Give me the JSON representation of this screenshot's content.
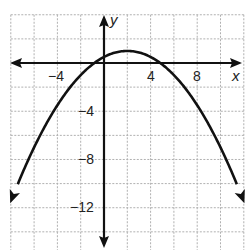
{
  "chart_data": {
    "type": "line",
    "title": "",
    "xlabel": "x",
    "ylabel": "y",
    "xlim": [
      -8,
      12
    ],
    "ylim": [
      -14,
      4
    ],
    "grid": true,
    "grid_step": 2,
    "x_tick_labels": [
      "-4",
      "4",
      "8"
    ],
    "y_tick_labels": [
      "-4",
      "-8",
      "-12"
    ],
    "equation": "y = -(1/8)(x - 2)^2 + 1",
    "vertex": [
      2,
      1
    ],
    "x_intercepts": [
      -0.83,
      4.83
    ],
    "series": [
      {
        "name": "parabola",
        "x": [
          -8,
          -6,
          -4,
          -2,
          -1,
          0,
          1,
          2,
          3,
          4,
          5,
          6,
          8,
          10,
          12
        ],
        "values": [
          -11.5,
          -7,
          -3.5,
          -1,
          -0.125,
          0.5,
          0.875,
          1,
          0.875,
          0.5,
          -0.125,
          -1,
          -3.5,
          -7,
          -11.5
        ]
      }
    ],
    "color": "#111111"
  },
  "labels": {
    "x_axis": "x",
    "y_axis": "y",
    "xt_neg4": "−4",
    "xt_4": "4",
    "xt_8": "8",
    "yt_neg4": "−4",
    "yt_neg8": "−8",
    "yt_neg12": "−12"
  }
}
